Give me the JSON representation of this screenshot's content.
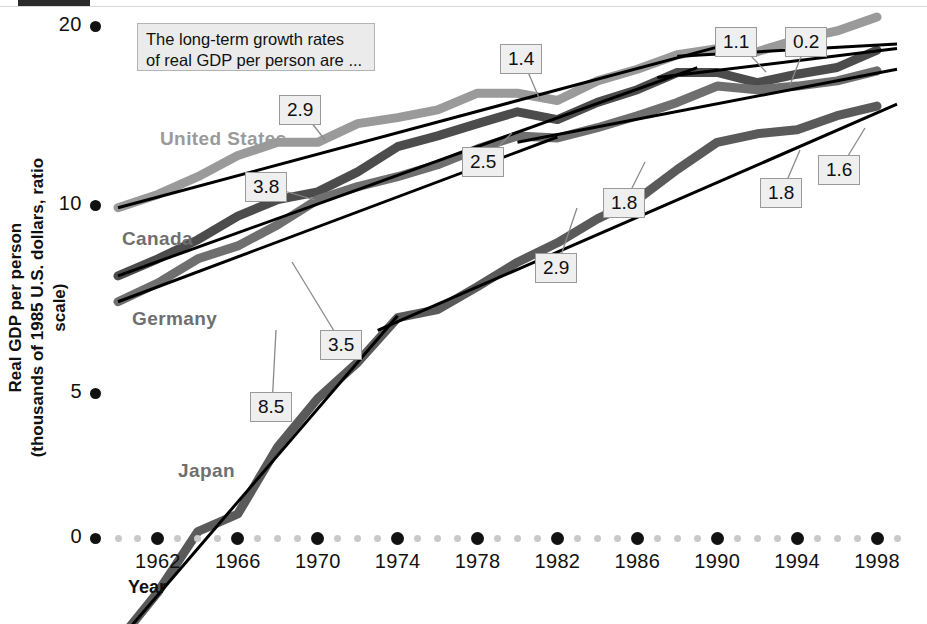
{
  "figure": {
    "note_text": "The long-term growth rates\nof real GDP per person are ...",
    "y_axis_title": "Real GDP per person\n(thousands of 1985 U.S. dollars, ratio scale)",
    "x_axis_title": "Year"
  },
  "chart_data": {
    "type": "line",
    "title": "",
    "xlabel": "Year",
    "ylabel": "Real GDP per person (thousands of 1985 U.S. dollars, ratio scale)",
    "scale": "ratio (log) scale",
    "grid": false,
    "legend": "inline series labels on plot",
    "xlim": [
      1960,
      1999
    ],
    "ylim": [
      0,
      20
    ],
    "y_ticks": [
      "0",
      "5",
      "10",
      "20"
    ],
    "y_tick_values": [
      0,
      5,
      10,
      20
    ],
    "x_ticks": [
      "1962",
      "1966",
      "1970",
      "1974",
      "1978",
      "1982",
      "1986",
      "1990",
      "1994",
      "1998"
    ],
    "x_tick_values": [
      1962,
      1966,
      1970,
      1974,
      1978,
      1982,
      1986,
      1990,
      1994,
      1998
    ],
    "x": [
      1960,
      1962,
      1964,
      1966,
      1968,
      1970,
      1972,
      1974,
      1976,
      1978,
      1980,
      1982,
      1984,
      1986,
      1988,
      1990,
      1992,
      1994,
      1996,
      1998
    ],
    "series": [
      {
        "name": "United States",
        "color": "#9a9a9a",
        "values": [
          9.9,
          10.4,
          11.1,
          12.0,
          12.6,
          12.6,
          13.5,
          13.8,
          14.2,
          15.1,
          15.1,
          14.7,
          15.8,
          16.5,
          17.4,
          17.8,
          17.6,
          18.4,
          19.0,
          20.0
        ]
      },
      {
        "name": "Canada",
        "color": "#4c4c4c",
        "values": [
          7.7,
          8.2,
          8.8,
          9.6,
          10.2,
          10.5,
          11.3,
          12.4,
          12.9,
          13.5,
          14.1,
          13.7,
          14.6,
          15.3,
          16.3,
          16.3,
          15.7,
          16.2,
          16.6,
          17.7
        ]
      },
      {
        "name": "Germany",
        "color": "#6f6f6f",
        "values": [
          7.0,
          7.5,
          8.2,
          8.6,
          9.3,
          10.2,
          10.7,
          11.1,
          11.6,
          12.3,
          12.9,
          12.8,
          13.3,
          13.9,
          14.6,
          15.5,
          15.3,
          15.5,
          15.8,
          16.4
        ]
      },
      {
        "name": "Japan",
        "color": "#5a5a5a",
        "values": [
          2.0,
          2.4,
          3.0,
          3.2,
          4.1,
          4.9,
          5.6,
          6.6,
          6.8,
          7.4,
          8.1,
          8.7,
          9.5,
          10.2,
          11.4,
          12.6,
          13.0,
          13.2,
          13.9,
          14.4
        ]
      }
    ],
    "trend_annotations": [
      {
        "label": "2.9",
        "series": "United States",
        "segment": "early",
        "box_x": 279,
        "box_y": 95,
        "anchor_x": 325,
        "anchor_y": 140
      },
      {
        "label": "3.8",
        "series": "Canada",
        "segment": "early",
        "box_x": 245,
        "box_y": 172,
        "anchor_x": 315,
        "anchor_y": 200
      },
      {
        "label": "1.4",
        "series": "United States",
        "segment": "late",
        "box_x": 500,
        "box_y": 44,
        "anchor_x": 540,
        "anchor_y": 100
      },
      {
        "label": "1.1",
        "series": "Canada",
        "segment": "late",
        "box_x": 715,
        "box_y": 27,
        "anchor_x": 766,
        "anchor_y": 72
      },
      {
        "label": "0.2",
        "series": "United States",
        "segment": "late",
        "box_x": 785,
        "box_y": 27,
        "anchor_x": 790,
        "anchor_y": 85
      },
      {
        "label": "2.5",
        "series": "Germany",
        "segment": "early",
        "box_x": 462,
        "box_y": 147,
        "anchor_x": 512,
        "anchor_y": 133
      },
      {
        "label": "1.8",
        "series": "Germany",
        "segment": "late",
        "box_x": 603,
        "box_y": 188,
        "anchor_x": 645,
        "anchor_y": 162
      },
      {
        "label": "1.8",
        "series": "Japan",
        "segment": "late",
        "box_x": 760,
        "box_y": 178,
        "anchor_x": 800,
        "anchor_y": 150
      },
      {
        "label": "1.6",
        "series": "Japan",
        "segment": "late",
        "box_x": 818,
        "box_y": 155,
        "anchor_x": 865,
        "anchor_y": 128
      },
      {
        "label": "2.9",
        "series": "Japan",
        "segment": "middle",
        "box_x": 535,
        "box_y": 253,
        "anchor_x": 577,
        "anchor_y": 208
      },
      {
        "label": "3.5",
        "series": "Germany",
        "segment": "early",
        "box_x": 320,
        "box_y": 330,
        "anchor_x": 292,
        "anchor_y": 262
      },
      {
        "label": "8.5",
        "series": "Japan",
        "segment": "early",
        "box_x": 250,
        "box_y": 392,
        "anchor_x": 276,
        "anchor_y": 330
      }
    ],
    "series_labels": [
      {
        "name": "United States",
        "x": 160,
        "y": 128,
        "color": "#9a9a9a"
      },
      {
        "name": "Canada",
        "x": 122,
        "y": 228,
        "color": "#6f6f6f"
      },
      {
        "name": "Germany",
        "x": 132,
        "y": 308,
        "color": "#6f6f6f"
      },
      {
        "name": "Japan",
        "x": 178,
        "y": 460,
        "color": "#6f6f6f"
      }
    ]
  },
  "source_note": ""
}
